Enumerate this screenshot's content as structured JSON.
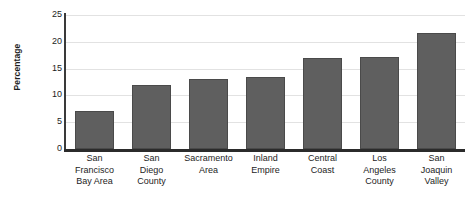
{
  "chart_data": {
    "type": "bar",
    "title": "",
    "subtitle": "",
    "xlabel": "",
    "ylabel": "Percentage",
    "ylim": [
      0,
      25
    ],
    "yticks": [
      0,
      5,
      10,
      15,
      20,
      25
    ],
    "ytick_labels": [
      "0",
      "5",
      "10",
      "15",
      "20",
      "25"
    ],
    "grid": true,
    "legend": false,
    "legend_position": "none",
    "bar_color": "#5f5f5f",
    "bar_edge_color": "#4a4a4a",
    "gridline_color": "#e2e2e2",
    "axis_color": "#2b2b2b",
    "categories": [
      "San Francisco Bay Area",
      "San Diego County",
      "Sacramento Area",
      "Inland Empire",
      "Central Coast",
      "Los Angeles County",
      "San Joaquin Valley"
    ],
    "category_lines": [
      [
        "San",
        "Francisco",
        "Bay Area"
      ],
      [
        "San",
        "Diego",
        "County"
      ],
      [
        "Sacramento",
        "Area"
      ],
      [
        "Inland",
        "Empire"
      ],
      [
        "Central",
        "Coast"
      ],
      [
        "Los",
        "Angeles",
        "County"
      ],
      [
        "San",
        "Joaquin",
        "Valley"
      ]
    ],
    "values": [
      7.0,
      12.0,
      13.0,
      13.5,
      17.0,
      17.2,
      21.7
    ]
  }
}
